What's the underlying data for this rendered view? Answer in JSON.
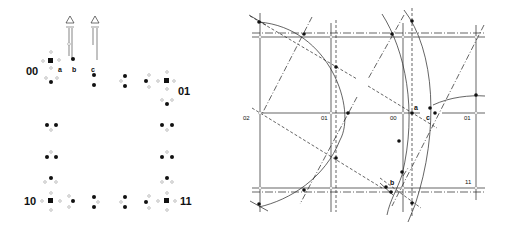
{
  "left_panel": {
    "corner_labels": {
      "top_left": "00",
      "top_right": "01",
      "bottom_left": "10",
      "bottom_right": "11"
    },
    "point_labels": {
      "a": "a",
      "b": "b",
      "c": "c"
    },
    "marker_symbol": "Δ"
  },
  "right_panel": {
    "grid_labels": {
      "o2": "02",
      "o1_left": "01",
      "o0": "00",
      "o1_right": "01",
      "o11": "11"
    },
    "point_labels": {
      "a": "a",
      "b": "b",
      "c": "c"
    }
  },
  "colors": {
    "ink": "#111111",
    "background": "#ffffff",
    "hollow": "#888888"
  }
}
